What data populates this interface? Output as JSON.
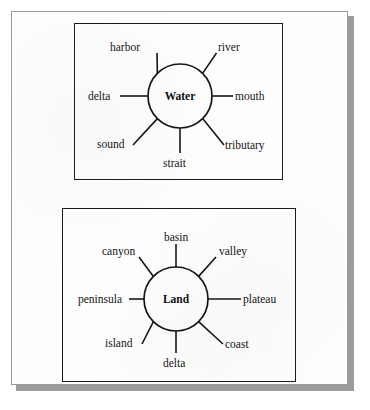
{
  "document": {
    "type": "word-web-diagram",
    "background_color": "#ffffff",
    "page_color": "#fefefe",
    "page_border_color": "#9a9a9a",
    "shadow_color": "#9b9b9b",
    "ink_color": "#161616"
  },
  "diagrams": [
    {
      "id": "water",
      "hub_label": "Water",
      "box": {
        "x": 74,
        "y": 23,
        "width": 209,
        "height": 157
      },
      "circle": {
        "cx": 180,
        "cy": 96,
        "r": 32
      },
      "spokes": [
        {
          "label": "harbor",
          "position": "upper-left",
          "angle_deg": 225,
          "label_x": 110,
          "label_y": 51,
          "anchor": "start",
          "line": {
            "x1": 157,
            "y1": 53,
            "x2": 157.4,
            "y2": 73.4
          }
        },
        {
          "label": "river",
          "position": "upper-right",
          "angle_deg": 315,
          "label_x": 218,
          "label_y": 51,
          "anchor": "start",
          "line": {
            "x1": 216.5,
            "y1": 53,
            "x2": 202.6,
            "y2": 73.4
          }
        },
        {
          "label": "delta",
          "position": "left",
          "angle_deg": 180,
          "label_x": 88,
          "label_y": 100,
          "anchor": "start",
          "line": {
            "x1": 120,
            "y1": 96,
            "x2": 148,
            "y2": 96
          }
        },
        {
          "label": "mouth",
          "position": "right",
          "angle_deg": 0,
          "label_x": 235,
          "label_y": 100,
          "anchor": "start",
          "line": {
            "x1": 212,
            "y1": 96,
            "x2": 233,
            "y2": 96
          }
        },
        {
          "label": "sound",
          "position": "lower-left",
          "angle_deg": 135,
          "label_x": 97,
          "label_y": 148,
          "anchor": "start",
          "line": {
            "x1": 133,
            "y1": 145,
            "x2": 157.4,
            "y2": 118.6
          }
        },
        {
          "label": "tributary",
          "position": "lower-right",
          "angle_deg": 45,
          "label_x": 225,
          "label_y": 149,
          "anchor": "start",
          "line": {
            "x1": 224,
            "y1": 145,
            "x2": 202.6,
            "y2": 118.6
          }
        },
        {
          "label": "strait",
          "position": "bottom",
          "angle_deg": 90,
          "label_x": 163,
          "label_y": 167,
          "anchor": "start",
          "line": {
            "x1": 180,
            "y1": 128,
            "x2": 180,
            "y2": 153
          }
        }
      ]
    },
    {
      "id": "land",
      "hub_label": "Land",
      "box": {
        "x": 62,
        "y": 208,
        "width": 234,
        "height": 174
      },
      "circle": {
        "cx": 176,
        "cy": 299,
        "r": 32
      },
      "spokes": [
        {
          "label": "basin",
          "position": "top",
          "angle_deg": 270,
          "label_x": 164,
          "label_y": 241,
          "anchor": "start",
          "line": {
            "x1": 176,
            "y1": 244,
            "x2": 176,
            "y2": 267
          }
        },
        {
          "label": "canyon",
          "position": "upper-left",
          "angle_deg": 225,
          "label_x": 102,
          "label_y": 255,
          "anchor": "start",
          "line": {
            "x1": 139,
            "y1": 257,
            "x2": 153.4,
            "y2": 276.4
          }
        },
        {
          "label": "valley",
          "position": "upper-right",
          "angle_deg": 315,
          "label_x": 219,
          "label_y": 255,
          "anchor": "start",
          "line": {
            "x1": 216,
            "y1": 257,
            "x2": 198.6,
            "y2": 276.4
          }
        },
        {
          "label": "peninsula",
          "position": "left",
          "angle_deg": 180,
          "label_x": 78,
          "label_y": 303,
          "anchor": "start",
          "line": {
            "x1": 129,
            "y1": 299,
            "x2": 144,
            "y2": 299
          }
        },
        {
          "label": "plateau",
          "position": "right",
          "angle_deg": 0,
          "label_x": 243,
          "label_y": 303,
          "anchor": "start",
          "line": {
            "x1": 208,
            "y1": 299,
            "x2": 241,
            "y2": 299
          }
        },
        {
          "label": "island",
          "position": "lower-left",
          "angle_deg": 135,
          "label_x": 105,
          "label_y": 347,
          "anchor": "start",
          "line": {
            "x1": 142,
            "y1": 344,
            "x2": 153.4,
            "y2": 321.6
          }
        },
        {
          "label": "coast",
          "position": "lower-right",
          "angle_deg": 45,
          "label_x": 225,
          "label_y": 348,
          "anchor": "start",
          "line": {
            "x1": 223,
            "y1": 344,
            "x2": 198.6,
            "y2": 321.6
          }
        },
        {
          "label": "delta",
          "position": "bottom",
          "angle_deg": 90,
          "label_x": 163,
          "label_y": 367,
          "anchor": "start",
          "line": {
            "x1": 176,
            "y1": 331,
            "x2": 176,
            "y2": 353
          }
        }
      ]
    }
  ]
}
